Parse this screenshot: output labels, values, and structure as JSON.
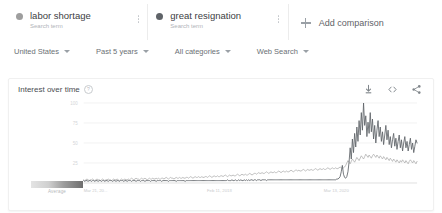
{
  "terms": [
    {
      "label": "labor shortage",
      "sublabel": "Search term",
      "color": "#9e9e9e",
      "menu_icon": "kebab-menu-icon"
    },
    {
      "label": "great resignation",
      "sublabel": "Search term",
      "color": "#5f6368",
      "menu_icon": "kebab-menu-icon"
    }
  ],
  "add_comparison": {
    "label": "Add comparison",
    "icon": "plus-icon"
  },
  "filters": [
    {
      "label": "United States",
      "icon": "chevron-down-icon"
    },
    {
      "label": "Past 5 years",
      "icon": "chevron-down-icon"
    },
    {
      "label": "All categories",
      "icon": "chevron-down-icon"
    },
    {
      "label": "Web Search",
      "icon": "chevron-down-icon"
    }
  ],
  "panel": {
    "title": "Interest over time",
    "help_icon": "help-circle-icon",
    "help_glyph": "?",
    "actions": [
      {
        "name": "download-icon",
        "title": "Download"
      },
      {
        "name": "embed-code-icon",
        "title": "Embed"
      },
      {
        "name": "share-icon",
        "title": "Share"
      }
    ]
  },
  "legend": {
    "average_label": "Average"
  },
  "chart_data": {
    "type": "line",
    "title": "Interest over time",
    "xlabel": "",
    "ylabel": "",
    "ylim": [
      0,
      100
    ],
    "yticks": [
      25,
      50,
      75,
      100
    ],
    "ytick_labels": [
      "25",
      "50",
      "75",
      "100"
    ],
    "grid": true,
    "legend_position": "top-cards",
    "xtick_labels": [
      "Mar 21, 20...",
      "Feb 11, 2018",
      "Mar 13, 2020"
    ],
    "xtick_positions": [
      0,
      0.37,
      0.72
    ],
    "x_range": "Mar 2016 - Mar 2021 (weekly)",
    "annotations": [
      "Average"
    ],
    "series": [
      {
        "name": "labor shortage",
        "color": "#b4b4b4",
        "values": [
          4,
          3,
          4,
          5,
          4,
          3,
          4,
          4,
          5,
          4,
          3,
          4,
          5,
          4,
          4,
          3,
          4,
          5,
          4,
          3,
          4,
          4,
          5,
          4,
          4,
          3,
          4,
          5,
          4,
          4,
          5,
          4,
          3,
          4,
          5,
          4,
          4,
          5,
          4,
          4,
          5,
          4,
          5,
          6,
          5,
          4,
          5,
          6,
          5,
          5,
          4,
          5,
          6,
          5,
          5,
          6,
          5,
          4,
          5,
          6,
          5,
          5,
          6,
          5,
          5,
          6,
          5,
          6,
          5,
          5,
          6,
          6,
          5,
          6,
          7,
          6,
          5,
          6,
          7,
          6,
          6,
          5,
          6,
          7,
          6,
          6,
          7,
          6,
          6,
          7,
          6,
          6,
          7,
          7,
          6,
          7,
          8,
          7,
          6,
          7,
          8,
          7,
          7,
          8,
          7,
          7,
          8,
          7,
          7,
          8,
          8,
          7,
          8,
          9,
          8,
          7,
          8,
          9,
          8,
          8,
          9,
          8,
          8,
          9,
          9,
          8,
          9,
          10,
          9,
          8,
          9,
          10,
          9,
          9,
          10,
          9,
          9,
          10,
          11,
          10,
          9,
          10,
          11,
          10,
          10,
          11,
          10,
          10,
          11,
          12,
          11,
          10,
          11,
          12,
          12,
          11,
          12,
          13,
          12,
          12,
          13,
          12,
          12,
          13,
          14,
          13,
          12,
          13,
          14,
          13,
          13,
          14,
          13,
          13,
          14,
          15,
          14,
          13,
          14,
          15,
          14,
          14,
          15,
          14,
          14,
          15,
          16,
          15,
          14,
          15,
          16,
          16,
          15,
          16,
          15,
          15,
          16,
          17,
          16,
          15,
          16,
          17,
          16,
          16,
          17,
          16,
          16,
          17,
          18,
          17,
          16,
          17,
          18,
          17,
          17,
          18,
          17,
          17,
          18,
          19,
          18,
          17,
          18,
          19,
          18,
          18,
          19,
          18,
          18,
          19,
          20,
          19,
          18,
          19,
          20,
          22,
          25,
          28,
          26,
          24,
          27,
          30,
          28,
          26,
          29,
          32,
          30,
          28,
          31,
          34,
          32,
          30,
          33,
          36,
          34,
          32,
          35,
          33,
          31,
          34,
          36,
          34,
          32,
          35,
          33,
          31,
          34,
          32,
          30,
          33,
          31,
          29,
          32,
          30,
          28,
          31,
          29,
          27,
          30,
          28,
          26,
          29,
          27,
          25,
          28,
          26,
          29,
          27,
          25,
          28,
          26,
          24,
          27,
          29,
          27,
          25,
          28,
          26,
          24,
          27
        ]
      },
      {
        "name": "great resignation",
        "color": "#5f6368",
        "values": [
          3,
          2,
          3,
          3,
          2,
          3,
          3,
          2,
          3,
          3,
          2,
          3,
          3,
          2,
          3,
          3,
          2,
          3,
          3,
          2,
          3,
          3,
          2,
          3,
          3,
          3,
          2,
          3,
          3,
          2,
          3,
          3,
          2,
          3,
          3,
          3,
          2,
          3,
          3,
          2,
          3,
          3,
          3,
          2,
          3,
          3,
          3,
          2,
          3,
          3,
          3,
          2,
          3,
          3,
          3,
          2,
          3,
          3,
          3,
          3,
          2,
          3,
          3,
          3,
          3,
          2,
          3,
          3,
          3,
          3,
          2,
          3,
          3,
          3,
          3,
          3,
          2,
          3,
          3,
          3,
          3,
          3,
          3,
          2,
          3,
          3,
          3,
          3,
          3,
          3,
          3,
          2,
          3,
          3,
          3,
          3,
          3,
          3,
          3,
          3,
          3,
          3,
          3,
          3,
          3,
          3,
          3,
          3,
          3,
          3,
          3,
          3,
          3,
          3,
          3,
          3,
          3,
          3,
          3,
          3,
          3,
          3,
          3,
          3,
          3,
          3,
          3,
          3,
          3,
          4,
          3,
          3,
          3,
          4,
          3,
          3,
          4,
          3,
          3,
          4,
          3,
          4,
          3,
          3,
          4,
          3,
          4,
          3,
          4,
          3,
          4,
          4,
          3,
          4,
          4,
          3,
          4,
          4,
          4,
          3,
          4,
          4,
          4,
          4,
          3,
          4,
          4,
          4,
          4,
          4,
          4,
          4,
          4,
          4,
          4,
          4,
          4,
          4,
          4,
          4,
          4,
          4,
          4,
          4,
          4,
          4,
          4,
          4,
          4,
          4,
          4,
          4,
          4,
          4,
          4,
          4,
          4,
          4,
          4,
          4,
          4,
          4,
          4,
          4,
          4,
          4,
          4,
          4,
          4,
          4,
          4,
          4,
          4,
          4,
          4,
          4,
          4,
          4,
          4,
          4,
          4,
          4,
          4,
          4,
          4,
          4,
          4,
          5,
          5,
          6,
          8,
          14,
          22,
          11,
          7,
          6,
          8,
          14,
          26,
          44,
          30,
          55,
          38,
          62,
          45,
          70,
          52,
          78,
          60,
          88,
          66,
          100,
          72,
          84,
          58,
          76,
          62,
          88,
          64,
          80,
          55,
          72,
          50,
          66,
          78,
          58,
          70,
          52,
          64,
          48,
          60,
          72,
          54,
          66,
          48,
          58,
          44,
          54,
          62,
          46,
          56,
          42,
          52,
          60,
          44,
          54,
          40,
          50,
          58,
          44,
          52,
          40,
          48,
          56,
          42,
          50,
          38,
          46,
          54,
          50
        ]
      }
    ]
  }
}
